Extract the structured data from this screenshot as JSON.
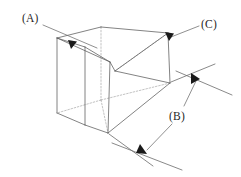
{
  "figure": {
    "background_color": "#ffffff",
    "edge_color": "#5a5a5a",
    "hidden_edge_color": "#a8a8a8",
    "leader_color": "#6b6b6b",
    "arrow_color": "#1a1a1a",
    "text_color": "#1f1f1f",
    "callouts": [
      {
        "id": "A",
        "label": "(A)",
        "label_x": 22,
        "label_y": 21,
        "leader": "M44,24 L96,47",
        "arrow_points": "68,41 76,41 72,49",
        "arrow_rotation": 20,
        "target": "top-left-near-edge"
      },
      {
        "id": "B",
        "label": "(B)",
        "label_x": 169,
        "label_y": 119,
        "leader_upper": "M186,106 L196,80",
        "leader_lower": "M170,126 L146,151",
        "arrow_upper_points": "192,75 200,79 193,84",
        "arrow_lower_points": "140,146 147,154 137,155",
        "target": "overall-length-dimension"
      },
      {
        "id": "C",
        "label": "(C)",
        "label_x": 201,
        "label_y": 27,
        "leader": "M199,27 L172,38",
        "arrow_points": "166,34 174,34 170,42",
        "target": "top-right-near-edge"
      }
    ],
    "dimension_lines": [
      {
        "name": "length-extension-upper",
        "path": "M170,83 L213,66"
      },
      {
        "name": "length-extension-lower",
        "path": "M108,133 L152,163"
      },
      {
        "name": "length-dimension-axis",
        "path": "M205,58 L231,95"
      },
      {
        "name": "length-dimension-axis-lower",
        "path": "M119,142 L168,163"
      }
    ],
    "geometry": {
      "name": "triangular-wedge-block",
      "visible_faces": [
        {
          "name": "top-face",
          "path": "M57,38 L101,27 L168,33 L115,71 L110,62 Z"
        },
        {
          "name": "left-front-face",
          "path": "M57,38 L85,47 L85,125 L57,113 Z"
        },
        {
          "name": "front-slanted-face",
          "path": "M85,47 L110,62 L108,133 L85,125 Z"
        },
        {
          "name": "right-wedge-face",
          "path": "M110,62 L115,71 L168,33 L170,83 L108,133 Z"
        }
      ],
      "visible_edges": [
        "M57,38 L101,27",
        "M101,27 L168,33",
        "M168,33 L115,71",
        "M115,71 L110,62",
        "M110,62 L57,38",
        "M57,38 L57,113",
        "M57,113 L85,125",
        "M85,125 L85,47",
        "M85,47 L57,38",
        "M85,47 L110,62",
        "M110,62 L108,133",
        "M108,133 L85,125",
        "M168,33 L170,83",
        "M170,83 L108,133",
        "M115,71 L170,83"
      ],
      "hidden_edges": [
        "M101,27 L101,100",
        "M101,100 L57,113",
        "M101,100 L204,82",
        "M168,33 L168,33",
        "M101,100 L108,133",
        "M115,71 L115,71"
      ]
    }
  }
}
